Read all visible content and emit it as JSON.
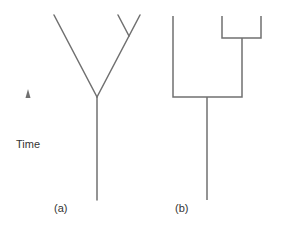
{
  "figure": {
    "time_axis": {
      "label": "Time",
      "icon": "arrow-up-icon"
    },
    "panels": [
      {
        "id": "a",
        "label": "(a)",
        "style": "diagonal branching tree"
      },
      {
        "id": "b",
        "label": "(b)",
        "style": "rectangular cladogram"
      }
    ],
    "colors": {
      "line": "#707070",
      "text": "#333333",
      "background": "#ffffff"
    }
  }
}
